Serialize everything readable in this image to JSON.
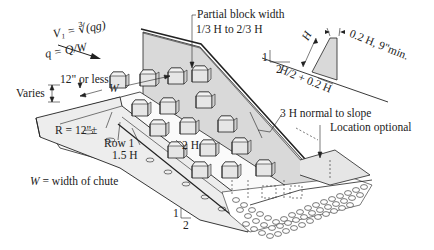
{
  "diagram": {
    "formulas": {
      "v1": "V₁ = ∛(qg)",
      "v1_lhs": "V",
      "v1_sub": "1",
      "v1_rhs": "= ³√qg",
      "q": "q = Q/W"
    },
    "labels": {
      "crest_height": "12\" or less",
      "varies": "Varies",
      "width": "W",
      "radius": "R = 12\"±",
      "row1": "Row 1",
      "row_spacing": "1.5 H",
      "block_spacing": "2 H",
      "partial_block": "Partial block width",
      "partial_block_range": "1/3 H to 2/3 H",
      "block_height": "H",
      "block_top": "0.2 H, 9\"min.",
      "block_base": "H/2 + 0.2 H",
      "normal_dist": "3 H normal to slope",
      "location": "Location optional",
      "slope_rise": "1",
      "slope_run": "2",
      "slope2_rise": "1",
      "slope2_run": "2",
      "legend_w": "W",
      "legend_text": "= width of chute"
    },
    "colors": {
      "wall_fill": "#d9d9d9",
      "block_fill": "#e6e6e6",
      "line": "#222222",
      "riprap": "#ffffff"
    }
  }
}
